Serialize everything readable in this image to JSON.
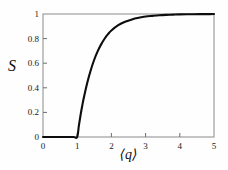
{
  "chart_data": {
    "type": "line",
    "title": "",
    "subtitle": "",
    "xlabel": "⟨q⟩",
    "ylabel": "S",
    "xlim": [
      0,
      5
    ],
    "ylim": [
      0,
      1
    ],
    "xticks": [
      "0",
      "1",
      "2",
      "3",
      "4",
      "5"
    ],
    "xtick_values": [
      0,
      1,
      2,
      3,
      4,
      5
    ],
    "yticks": [
      "0",
      "0.2",
      "0.4",
      "0.6",
      "0.8",
      "1"
    ],
    "ytick_values": [
      0,
      0.2,
      0.4,
      0.6,
      0.8,
      1
    ],
    "grid": false,
    "legend": null,
    "annotations": [],
    "series": [
      {
        "name": "S",
        "color": "#0d0d0d",
        "linewidth": 2.1,
        "x": [
          0.0,
          0.1,
          0.2,
          0.3,
          0.4,
          0.5,
          0.6,
          0.7,
          0.8,
          0.9,
          1.0,
          1.05,
          1.1,
          1.15,
          1.2,
          1.3,
          1.4,
          1.5,
          1.6,
          1.7,
          1.8,
          1.9,
          2.0,
          2.2,
          2.4,
          2.6,
          2.8,
          3.0,
          3.2,
          3.4,
          3.6,
          3.8,
          4.0,
          4.2,
          4.4,
          4.6,
          4.8,
          5.0
        ],
        "y": [
          0.0,
          0.0,
          0.0,
          0.0,
          0.0,
          0.0,
          0.0,
          0.0,
          0.0,
          0.0,
          0.0,
          0.095,
          0.181,
          0.258,
          0.327,
          0.447,
          0.547,
          0.63,
          0.698,
          0.753,
          0.799,
          0.836,
          0.866,
          0.909,
          0.937,
          0.956,
          0.969,
          0.979,
          0.985,
          0.99,
          0.993,
          0.995,
          0.997,
          0.998,
          0.9985,
          0.999,
          0.9993,
          0.9995
        ]
      }
    ]
  },
  "axes": {
    "frame_color": "#8a8a8a",
    "tick_color": "#6f6f6f",
    "label_color": "#1a1a1a"
  },
  "figure": {
    "background": "#fefefe"
  }
}
